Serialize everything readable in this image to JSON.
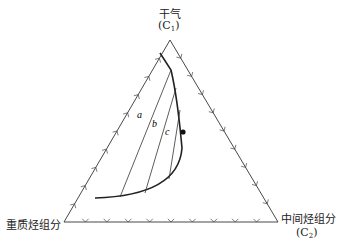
{
  "diagram": {
    "type": "ternary phase diagram",
    "vertices": {
      "top": {
        "label": "干气",
        "formula_main": "(C",
        "formula_sub": "1",
        "formula_end": ")"
      },
      "left": {
        "label": "重质烃组分"
      },
      "right": {
        "label": "中间烃组分",
        "formula_main": "(C",
        "formula_sub": "2",
        "formula_end": ")"
      }
    },
    "tie_lines": [
      "a",
      "b",
      "c"
    ],
    "critical_point": "plait point marker",
    "ticks_per_side": 9
  }
}
